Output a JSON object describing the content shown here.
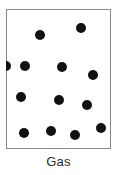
{
  "figure": {
    "caption": "Gas",
    "caption_color": "#2b2b2b",
    "background_color": "#ffffff"
  },
  "container": {
    "name": "gas-container",
    "border_color": "#888888",
    "fill_color": "#ffffff",
    "x": 6,
    "y": 9,
    "width": 105,
    "height": 140
  },
  "particles": {
    "count": 13,
    "color": "#111111",
    "diameter": 10,
    "items": [
      {
        "id": 1,
        "cx": 40,
        "cy": 35
      },
      {
        "id": 2,
        "cx": 81,
        "cy": 28
      },
      {
        "id": 3,
        "cx": 25,
        "cy": 66
      },
      {
        "id": 4,
        "cx": 62,
        "cy": 67
      },
      {
        "id": 5,
        "cx": 93,
        "cy": 75
      },
      {
        "id": 6,
        "cx": 21,
        "cy": 97
      },
      {
        "id": 7,
        "cx": 59,
        "cy": 100
      },
      {
        "id": 8,
        "cx": 87,
        "cy": 105
      },
      {
        "id": 9,
        "cx": 24,
        "cy": 133
      },
      {
        "id": 10,
        "cx": 51,
        "cy": 131
      },
      {
        "id": 11,
        "cx": 75,
        "cy": 135
      },
      {
        "id": 12,
        "cx": 101,
        "cy": 128
      },
      {
        "id": 13,
        "cx": 6,
        "cy": 66
      }
    ]
  }
}
